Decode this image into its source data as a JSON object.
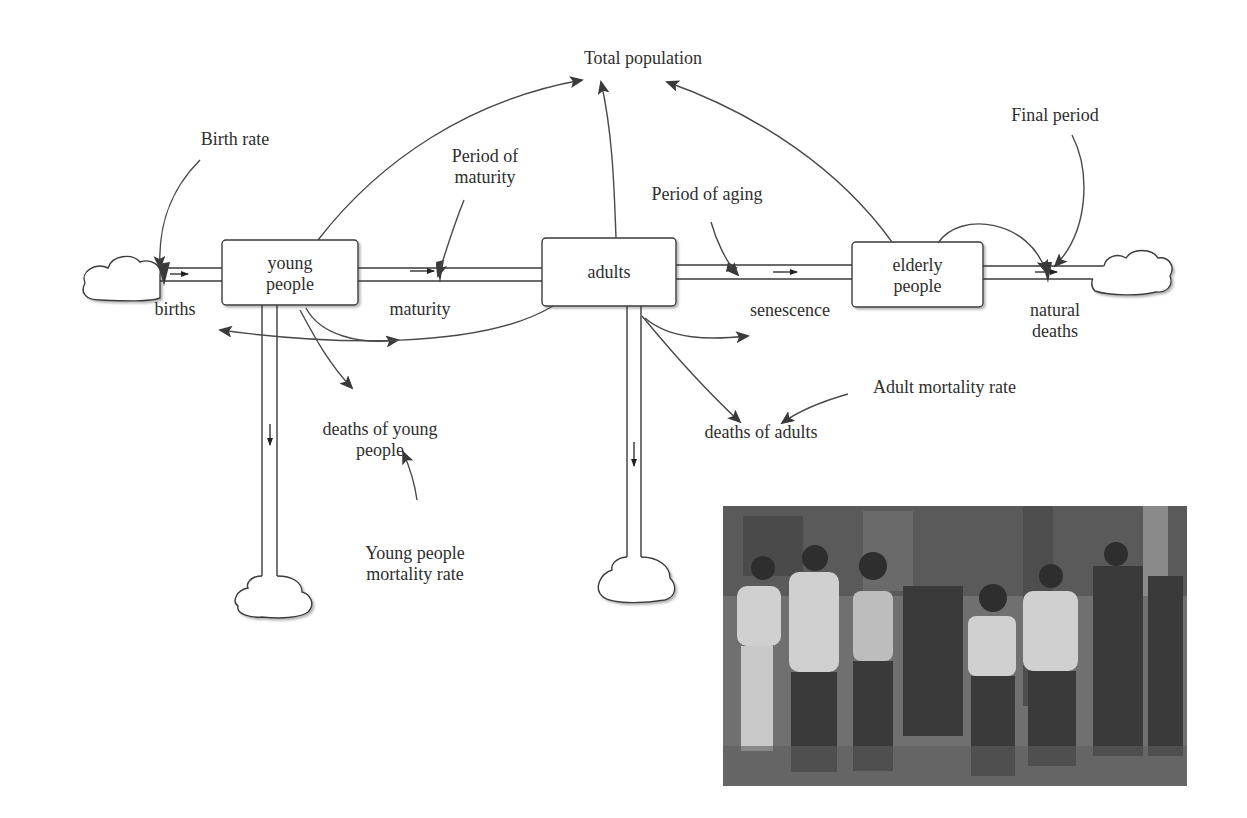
{
  "diagram": {
    "type": "stock-and-flow",
    "stocks": [
      {
        "id": "young",
        "label": "young\npeople",
        "line1": "young",
        "line2": "people"
      },
      {
        "id": "adults",
        "label": "adults"
      },
      {
        "id": "elderly",
        "label": "elderly\npeople",
        "line1": "elderly",
        "line2": "people"
      }
    ],
    "flows": [
      {
        "id": "births",
        "label": "births"
      },
      {
        "id": "maturity",
        "label": "maturity"
      },
      {
        "id": "senescence",
        "label": "senescence"
      },
      {
        "id": "natural_deaths",
        "line1": "natural",
        "line2": "deaths"
      },
      {
        "id": "deaths_young",
        "line1": "deaths of young",
        "line2": "people"
      },
      {
        "id": "deaths_adults",
        "label": "deaths of adults"
      }
    ],
    "auxiliaries": [
      {
        "id": "total_population",
        "label": "Total population"
      },
      {
        "id": "birth_rate",
        "label": "Birth rate"
      },
      {
        "id": "period_maturity",
        "line1": "Period of",
        "line2": "maturity"
      },
      {
        "id": "period_aging",
        "label": "Period of aging"
      },
      {
        "id": "final_period",
        "label": "Final period"
      },
      {
        "id": "adult_mortality",
        "label": "Adult mortality rate"
      },
      {
        "id": "young_mortality",
        "line1": "Young people",
        "line2": "mortality rate"
      }
    ],
    "links": [
      {
        "from": "Birth rate",
        "to": "births"
      },
      {
        "from": "young people",
        "to": "Total population"
      },
      {
        "from": "adults",
        "to": "Total population"
      },
      {
        "from": "elderly people",
        "to": "Total population"
      },
      {
        "from": "Period of maturity",
        "to": "maturity"
      },
      {
        "from": "young people",
        "to": "maturity"
      },
      {
        "from": "young people",
        "to": "deaths of young people"
      },
      {
        "from": "adults",
        "to": "births"
      },
      {
        "from": "adults",
        "to": "senescence"
      },
      {
        "from": "adults",
        "to": "deaths of adults"
      },
      {
        "from": "Period of aging",
        "to": "senescence"
      },
      {
        "from": "Adult mortality rate",
        "to": "deaths of adults"
      },
      {
        "from": "Young people mortality rate",
        "to": "deaths of young people"
      },
      {
        "from": "elderly people",
        "to": "natural deaths"
      },
      {
        "from": "Final period",
        "to": "natural deaths"
      }
    ]
  },
  "photo": {
    "description": "grayscale photo of a group of people walking on a street"
  }
}
